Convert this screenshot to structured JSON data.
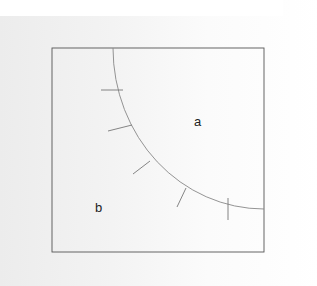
{
  "diagram": {
    "type": "region-diagram",
    "frame": {
      "x": 52,
      "y": 48,
      "width": 212,
      "height": 204,
      "stroke": "#555555"
    },
    "curve": {
      "description": "quarter-ellipse boundary separating region a (upper right) from region b (lower left)",
      "center": [
        264,
        48
      ],
      "rx": 151,
      "ry": 161,
      "stroke": "#888888"
    },
    "ticks": [
      {
        "x1": 101,
        "y1": 90,
        "x2": 123,
        "y2": 90
      },
      {
        "x1": 108,
        "y1": 131,
        "x2": 132,
        "y2": 125
      },
      {
        "x1": 133,
        "y1": 174,
        "x2": 150,
        "y2": 161
      },
      {
        "x1": 177,
        "y1": 207,
        "x2": 186,
        "y2": 188
      },
      {
        "x1": 228,
        "y1": 198,
        "x2": 228,
        "y2": 220
      }
    ],
    "labels": {
      "region_a": {
        "text": "a",
        "x": 194,
        "y": 126
      },
      "region_b": {
        "text": "b",
        "x": 95,
        "y": 212
      }
    }
  }
}
